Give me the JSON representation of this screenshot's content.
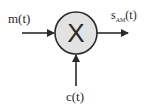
{
  "diagram": {
    "type": "block-diagram",
    "blocks": [
      {
        "id": "multiplier",
        "symbol": "X",
        "shape": "circle",
        "fill": "#e2e2e2",
        "stroke": "#2a2a2a"
      }
    ],
    "labels": {
      "message": "m(t)",
      "carrier": "c(t)",
      "output_main": "s",
      "output_sub": "AM",
      "output_tail": "(t)"
    },
    "edges": [
      {
        "from": "m(t)",
        "to": "multiplier"
      },
      {
        "from": "c(t)",
        "to": "multiplier"
      },
      {
        "from": "multiplier",
        "to": "s_AM(t)"
      }
    ],
    "colors": {
      "line": "#2a2a2a",
      "block_fill": "#e2e2e2"
    }
  }
}
